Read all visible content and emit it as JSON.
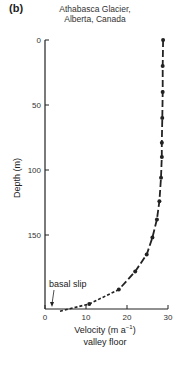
{
  "panel_label": "(b)",
  "title_line1": "Athabasca  Glacier,",
  "title_line2": "Alberta, Canada",
  "chart_data": {
    "type": "line",
    "title": "Athabasca Glacier, Alberta, Canada",
    "xlabel": "Velocity (m a⁻¹)",
    "xlabel_sub": "valley floor",
    "ylabel": "Depth (m)",
    "xlim": [
      0,
      30
    ],
    "ylim": [
      0,
      209
    ],
    "y_inverted": true,
    "x_ticks": [
      0,
      10,
      20,
      30
    ],
    "y_ticks": [
      0,
      50,
      100,
      150
    ],
    "grid": false,
    "series": [
      {
        "name": "velocity profile",
        "style": "dash-dot with markers",
        "points": [
          {
            "velocity": 28.8,
            "depth": 0
          },
          {
            "velocity": 28.7,
            "depth": 20
          },
          {
            "velocity": 28.7,
            "depth": 40
          },
          {
            "velocity": 28.6,
            "depth": 60
          },
          {
            "velocity": 28.5,
            "depth": 79
          },
          {
            "velocity": 28.5,
            "depth": 90
          },
          {
            "velocity": 28.3,
            "depth": 106
          },
          {
            "velocity": 27.9,
            "depth": 124
          },
          {
            "velocity": 27.3,
            "depth": 138
          },
          {
            "velocity": 26.2,
            "depth": 152
          },
          {
            "velocity": 24.8,
            "depth": 165
          },
          {
            "velocity": 22.0,
            "depth": 178
          },
          {
            "velocity": 18.0,
            "depth": 192
          },
          {
            "velocity": 10.8,
            "depth": 203
          },
          {
            "velocity": 3.2,
            "depth": 209
          }
        ],
        "dashed_extrapolation_below_depth": 192
      }
    ],
    "annotations": [
      {
        "text": "basal slip",
        "points_to": {
          "velocity": 2.5,
          "depth": 209
        }
      }
    ]
  },
  "axes": {
    "x_tick_labels": [
      "0",
      "10",
      "20",
      "30"
    ],
    "y_tick_labels": [
      "0",
      "50",
      "100",
      "150"
    ],
    "xlabel": "Velocity (m a",
    "xlabel_sup": "−1",
    "xlabel_close": ")",
    "xlabel_sub": "valley floor",
    "ylabel": "Depth (m)",
    "annotation": "basal slip"
  }
}
